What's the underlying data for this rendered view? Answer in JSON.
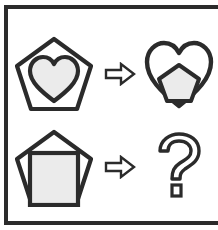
{
  "puzzle": {
    "type": "visual-analogy-matrix",
    "frame_color": "#2b2b2b",
    "background_color": "#ffffff",
    "stroke_color": "#2b2b2b",
    "fill_color": "#ebebeb",
    "rows": [
      {
        "id": "row-top",
        "left": {
          "name": "pentagon-with-heart",
          "outer_shape": "pentagon",
          "inner_shape": "heart",
          "alt": "Outlined pentagon containing a light gray heart"
        },
        "operator": {
          "name": "implies-arrow",
          "symbol": "⇒",
          "alt": "Hollow block arrow pointing right"
        },
        "right": {
          "name": "heart-with-pentagon",
          "outer_shape": "heart",
          "inner_shape": "pentagon",
          "alt": "Outlined heart containing a light gray pentagon"
        }
      },
      {
        "id": "row-bottom",
        "left": {
          "name": "pentagon-with-square",
          "outer_shape": "pentagon",
          "inner_shape": "square",
          "alt": "Outlined pentagon containing a light gray square"
        },
        "operator": {
          "name": "implies-arrow",
          "symbol": "⇒",
          "alt": "Hollow block arrow pointing right"
        },
        "right": {
          "name": "unknown-answer",
          "outer_shape": "question-mark",
          "inner_shape": "none",
          "alt": "Outlined question mark marking the missing answer"
        }
      }
    ]
  }
}
